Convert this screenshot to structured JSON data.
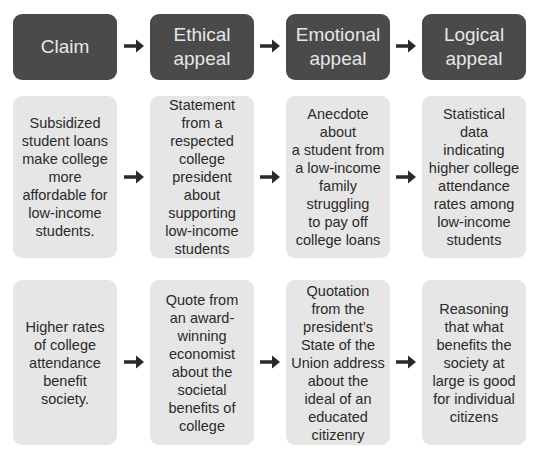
{
  "headers": [
    "Claim",
    "Ethical\nappeal",
    "Emotional\nappeal",
    "Logical\nappeal"
  ],
  "rows": [
    {
      "cells": [
        "Subsidized\nstudent loans\nmake college\nmore\naffordable for\nlow-income\nstudents.",
        "Statement\nfrom a\nrespected\ncollege\npresident\nabout\nsupporting\nlow-income\nstudents",
        "Anecdote about\na student from\na low-income\nfamily\nstruggling\nto pay off\ncollege loans",
        "Statistical\ndata\nindicating\nhigher college\nattendance\nrates among\nlow-income\nstudents"
      ]
    },
    {
      "cells": [
        "Higher rates\nof college\nattendance\nbenefit\nsociety.",
        "Quote from\nan award-\nwinning\neconomist\nabout the\nsocietal\nbenefits of\ncollege",
        "Quotation\nfrom the\npresident’s\nState of the\nUnion address\nabout the\nideal of an\neducated\ncitizenry",
        "Reasoning\nthat what\nbenefits the\nsociety at\nlarge is good\nfor individual\ncitizens"
      ]
    }
  ],
  "colors": {
    "header_bg": "#4a4a4a",
    "header_text": "#e6e6e6",
    "cell_bg": "#e6e6e6",
    "cell_text": "#2a2a2a",
    "arrow": "#2a2a2a"
  },
  "icons": {
    "connector": "right-arrow-icon"
  }
}
